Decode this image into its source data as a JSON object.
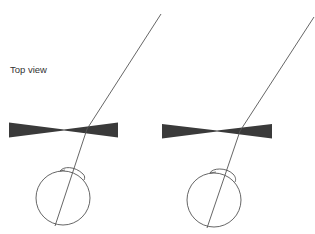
{
  "labels": {
    "view_title": "Top view"
  },
  "colors": {
    "stroke": "#555555",
    "bowtie_fill": "#3a3a3a",
    "background": "#ffffff"
  },
  "panels": [
    {
      "name": "left",
      "bowtie": {
        "x1": 9,
        "x2": 118,
        "cx": 64,
        "cy": 130,
        "half_height": 7.5
      },
      "line": {
        "x1": 161,
        "y1": 14,
        "xm": 87,
        "ym": 129,
        "x2": 55,
        "y2": 226
      },
      "eye": {
        "cx": 63,
        "cy": 198,
        "r": 27
      }
    },
    {
      "name": "right",
      "bowtie": {
        "x1": 162,
        "x2": 272,
        "cx": 217,
        "cy": 131,
        "half_height": 7.5
      },
      "line": {
        "x1": 314,
        "y1": 17,
        "xm": 240,
        "ym": 131,
        "x2": 207,
        "y2": 228
      },
      "eye": {
        "cx": 214,
        "cy": 200,
        "r": 27
      }
    }
  ]
}
